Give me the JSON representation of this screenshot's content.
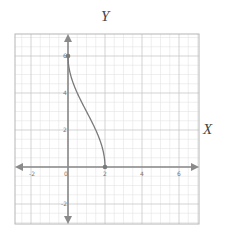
{
  "chart_data": {
    "type": "line",
    "title": "",
    "xlabel": "X",
    "ylabel": "Y",
    "xlim": [
      -2.9,
      7.1
    ],
    "ylim": [
      -3.1,
      7.2
    ],
    "x_ticks": [
      -2,
      0,
      2,
      4,
      6
    ],
    "y_ticks": [
      -2,
      2,
      4,
      6
    ],
    "x_tick_labels": [
      "-2",
      "0",
      "2",
      "4",
      "6"
    ],
    "y_tick_labels": [
      "-2",
      "2",
      "4",
      "6"
    ],
    "grid": {
      "major": 2,
      "minor": 0.5,
      "on": true
    },
    "series": [
      {
        "name": "curve",
        "equation": "x = 1 + cos(pi*y/6), 0 <= y <= 6",
        "points": [
          [
            2.0,
            0.0
          ],
          [
            1.97,
            0.5
          ],
          [
            1.87,
            1.0
          ],
          [
            1.71,
            1.5
          ],
          [
            1.5,
            2.0
          ],
          [
            1.26,
            2.5
          ],
          [
            1.0,
            3.0
          ],
          [
            0.74,
            3.5
          ],
          [
            0.5,
            4.0
          ],
          [
            0.29,
            4.5
          ],
          [
            0.13,
            5.0
          ],
          [
            0.03,
            5.5
          ],
          [
            0.0,
            6.0
          ]
        ],
        "endpoints": [
          [
            0,
            6
          ],
          [
            2,
            0
          ]
        ]
      }
    ],
    "colors": {
      "curve": "#7a7a7a",
      "axis": "#8a8a8a",
      "grid_major": "#c8c8c8",
      "grid_minor": "#e4e4e4",
      "frame": "#b5b5b5"
    }
  },
  "labels": {
    "x_axis": "X",
    "y_axis": "Y"
  }
}
